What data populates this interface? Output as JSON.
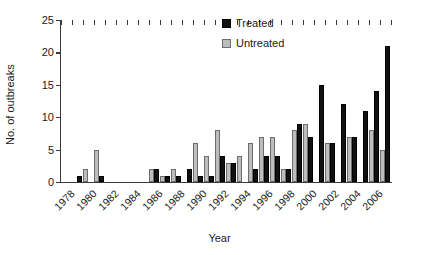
{
  "chart_data": {
    "type": "bar",
    "title": "",
    "xlabel": "Year",
    "ylabel": "No. of outbreaks",
    "ylim": [
      0,
      25
    ],
    "yticks": [
      0,
      5,
      10,
      15,
      20,
      25
    ],
    "grid": false,
    "legend_position": "top-center",
    "categories": [
      "1978",
      "1979",
      "1980",
      "1981",
      "1982",
      "1983",
      "1984",
      "1985",
      "1986",
      "1987",
      "1988",
      "1989",
      "1990",
      "1991",
      "1992",
      "1993",
      "1994",
      "1995",
      "1996",
      "1997",
      "1998",
      "1999",
      "2000",
      "2001",
      "2002",
      "2003",
      "2004",
      "2005",
      "2006",
      "2007"
    ],
    "xtick_labels": [
      "1978",
      "1980",
      "1982",
      "1984",
      "1986",
      "1988",
      "1990",
      "1992",
      "1994",
      "1996",
      "1998",
      "2000",
      "2002",
      "2004",
      "2006"
    ],
    "series": [
      {
        "name": "Treated",
        "color": "#111111",
        "values": [
          0,
          1,
          0,
          1,
          0,
          0,
          0,
          0,
          2,
          1,
          1,
          2,
          1,
          1,
          4,
          3,
          0,
          2,
          4,
          4,
          2,
          9,
          7,
          15,
          6,
          12,
          7,
          11,
          14,
          21
        ]
      },
      {
        "name": "Untreated",
        "color": "#bdbdbd",
        "values": [
          0,
          0,
          2,
          5,
          0,
          0,
          0,
          0,
          2,
          1,
          2,
          0,
          6,
          4,
          8,
          3,
          4,
          6,
          7,
          7,
          2,
          8,
          9,
          0,
          6,
          0,
          7,
          0,
          8,
          5
        ]
      }
    ]
  },
  "legend": {
    "items": [
      {
        "label": "Treated",
        "swatch": "treated"
      },
      {
        "label": "Untreated",
        "swatch": "untreated"
      }
    ]
  },
  "axis_titles": {
    "x": "Year",
    "y": "No. of outbreaks"
  }
}
